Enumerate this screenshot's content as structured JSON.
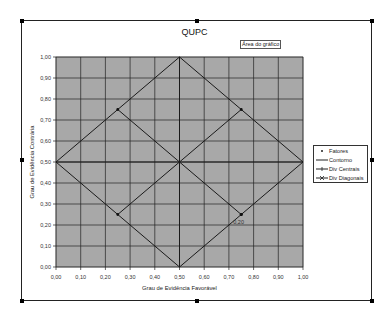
{
  "window": {
    "tooltip": "Área do gráfico"
  },
  "chart_data": {
    "type": "line",
    "title": "QUPC",
    "xlabel": "Grau de Evidência Favorável",
    "ylabel": "Grau de Evidência Contrária",
    "xlim": [
      0,
      1
    ],
    "ylim": [
      0,
      1
    ],
    "grid": true,
    "legend_position": "right",
    "x_ticks": [
      "0,00",
      "0,10",
      "0,20",
      "0,30",
      "0,40",
      "0,50",
      "0,60",
      "0,70",
      "0,80",
      "0,90",
      "1,00"
    ],
    "y_ticks": [
      "0,00",
      "0,10",
      "0,20",
      "0,30",
      "0,40",
      "0,50",
      "0,60",
      "0,70",
      "0,80",
      "0,90",
      "1,00"
    ],
    "series": [
      {
        "name": "Fatores",
        "points": [
          [
            0.75,
            0.25
          ]
        ],
        "data_label": "0,20"
      },
      {
        "name": "Contorno",
        "points": [
          [
            0.0,
            0.5
          ],
          [
            0.5,
            1.0
          ],
          [
            1.0,
            0.5
          ],
          [
            0.5,
            0.0
          ],
          [
            0.0,
            0.5
          ]
        ]
      },
      {
        "name": "Div Centrais",
        "points": [
          [
            0.0,
            0.5
          ],
          [
            1.0,
            0.5
          ],
          [
            0.5,
            0.5
          ],
          [
            0.5,
            1.0
          ],
          [
            0.5,
            0.0
          ]
        ]
      },
      {
        "name": "Div Diagonais",
        "points": [
          [
            0.25,
            0.75
          ],
          [
            0.75,
            0.25
          ],
          [
            0.5,
            0.5
          ],
          [
            0.25,
            0.25
          ],
          [
            0.75,
            0.75
          ]
        ]
      }
    ],
    "legend": [
      "Fatores",
      "Contorno",
      "Div Centrais",
      "Div Diagonais"
    ],
    "plot_bg": "#a8a8a8",
    "line_color": "#1a1a1a"
  }
}
